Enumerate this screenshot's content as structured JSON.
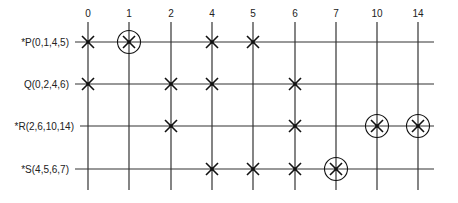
{
  "diagram": {
    "type": "prime-implicant-chart",
    "columns": [
      "0",
      "1",
      "2",
      "4",
      "5",
      "6",
      "7",
      "10",
      "14"
    ],
    "column_x": [
      88,
      129,
      171,
      212,
      253,
      295,
      336,
      377,
      418
    ],
    "rows": [
      {
        "label": "*P(0,1,4,5)",
        "y": 42,
        "essential": true,
        "covers": [
          "0",
          "1",
          "4",
          "5"
        ],
        "circled": [
          "1"
        ]
      },
      {
        "label": "Q(0,2,4,6)",
        "y": 84,
        "essential": false,
        "covers": [
          "0",
          "2",
          "4",
          "6"
        ],
        "circled": []
      },
      {
        "label": "*R(2,6,10,14)",
        "y": 126,
        "essential": true,
        "covers": [
          "2",
          "6",
          "10",
          "14"
        ],
        "circled": [
          "10",
          "14"
        ]
      },
      {
        "label": "*S(4,5,6,7)",
        "y": 169,
        "essential": true,
        "covers": [
          "4",
          "5",
          "6",
          "7"
        ],
        "circled": [
          "7"
        ]
      }
    ],
    "line_color": "#333333",
    "mark_color": "#111111"
  }
}
